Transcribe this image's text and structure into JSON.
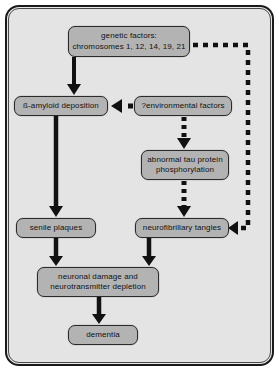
{
  "figure": {
    "background_color": "#e4e4e4",
    "node_fill_color": "#b3b3b3",
    "line_color": "#111111"
  },
  "nodes": [
    {
      "id": "genetic",
      "label": "genetic factors:\nchromosomes 1, 12, 14, 19, 21"
    },
    {
      "id": "amyloid",
      "label": "ß-amyloid deposition"
    },
    {
      "id": "environmental",
      "label": "?environmental factors"
    },
    {
      "id": "tau",
      "label": "abnormal tau protein\nphosphorylation"
    },
    {
      "id": "senile",
      "label": "senile plaques"
    },
    {
      "id": "tangles",
      "label": "neurofibrillary tangles"
    },
    {
      "id": "neuronal",
      "label": "neuronal damage and\nneurotransmitter depletion"
    },
    {
      "id": "dementia",
      "label": "dementia"
    }
  ],
  "connectors": [
    {
      "id": "genetic-to-amyloid",
      "style": "solid",
      "from": "genetic",
      "to": "amyloid",
      "direction": "down"
    },
    {
      "id": "genetic-to-tangles",
      "style": "dashed",
      "from": "genetic",
      "to": "tangles",
      "direction": "right-down-left"
    },
    {
      "id": "environmental-to-amyloid",
      "style": "dashed",
      "from": "environmental",
      "to": "amyloid",
      "direction": "left"
    },
    {
      "id": "environmental-to-tau",
      "style": "dashed",
      "from": "environmental",
      "to": "tau",
      "direction": "down"
    },
    {
      "id": "tau-to-tangles",
      "style": "dashed",
      "from": "tau",
      "to": "tangles",
      "direction": "down"
    },
    {
      "id": "amyloid-to-senile",
      "style": "solid",
      "from": "amyloid",
      "to": "senile",
      "direction": "down"
    },
    {
      "id": "senile-to-neuronal",
      "style": "solid",
      "from": "senile",
      "to": "neuronal",
      "direction": "down"
    },
    {
      "id": "tangles-to-neuronal",
      "style": "solid",
      "from": "tangles",
      "to": "neuronal",
      "direction": "down"
    },
    {
      "id": "neuronal-to-dementia",
      "style": "solid",
      "from": "neuronal",
      "to": "dementia",
      "direction": "down"
    }
  ]
}
